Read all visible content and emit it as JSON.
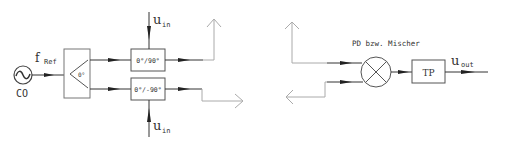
{
  "diagram": {
    "oscillator": {
      "label": "CO",
      "symbol": "~"
    },
    "reference": {
      "main": "f",
      "sub": "Ref"
    },
    "splitter": {
      "label": "0°"
    },
    "phase_shifter_top": {
      "label": "0°/90°"
    },
    "phase_shifter_bottom": {
      "label": "0°/-90°"
    },
    "input_top": {
      "main": "u",
      "sub": "in"
    },
    "input_bottom": {
      "main": "u",
      "sub": "in"
    },
    "mixer": {
      "label": "PD bzw. Mischer"
    },
    "lowpass": {
      "label": "TP"
    },
    "output": {
      "main": "u",
      "sub": "out"
    }
  },
  "colors": {
    "line": "#333333",
    "faded_line": "#aaaaaa",
    "box_border": "#555555"
  }
}
